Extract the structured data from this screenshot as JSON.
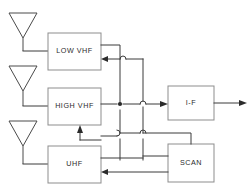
{
  "diagram": {
    "canvas": {
      "width": 251,
      "height": 195,
      "background": "#ffffff"
    },
    "colors": {
      "box_stroke": "#8d8d8d",
      "wire": "#3a3a3a",
      "antenna": "#4a4a4a",
      "text": "#2b2b2b",
      "background": "#ffffff"
    },
    "blocks": [
      {
        "id": "low_vhf",
        "label": "LOW VHF",
        "x": 48,
        "y": 33,
        "w": 53,
        "h": 37
      },
      {
        "id": "high_vhf",
        "label": "HIGH VHF",
        "x": 48,
        "y": 88,
        "w": 53,
        "h": 37
      },
      {
        "id": "uhf",
        "label": "UHF",
        "x": 48,
        "y": 146,
        "w": 53,
        "h": 37
      },
      {
        "id": "if",
        "label": "I-F",
        "x": 168,
        "y": 86,
        "w": 46,
        "h": 34
      },
      {
        "id": "scan",
        "label": "SCAN",
        "x": 168,
        "y": 144,
        "w": 46,
        "h": 38
      }
    ],
    "antennas": [
      {
        "id": "antenna-low-vhf",
        "label": "",
        "apex_x": 23,
        "top_y": 12,
        "stem_bottom_y": 46
      },
      {
        "id": "antenna-high-vhf",
        "label": "",
        "apex_x": 23,
        "top_y": 65,
        "stem_bottom_y": 99
      },
      {
        "id": "antenna-uhf",
        "label": "",
        "apex_x": 23,
        "top_y": 120,
        "stem_bottom_y": 154
      }
    ],
    "signal_flow": [
      {
        "from": "antenna-low-vhf",
        "to": "low_vhf"
      },
      {
        "from": "antenna-high-vhf",
        "to": "high_vhf"
      },
      {
        "from": "antenna-uhf",
        "to": "uhf"
      },
      {
        "from": "low_vhf",
        "to": "if"
      },
      {
        "from": "high_vhf",
        "to": "if"
      },
      {
        "from": "uhf",
        "to": "if"
      },
      {
        "from": "scan",
        "to": "low_vhf"
      },
      {
        "from": "scan",
        "to": "high_vhf"
      },
      {
        "from": "scan",
        "to": "uhf"
      },
      {
        "from": "if",
        "to": "output"
      }
    ],
    "output_label": ""
  }
}
